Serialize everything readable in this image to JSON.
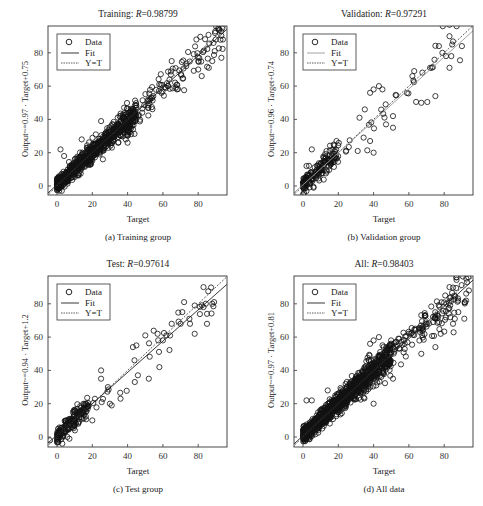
{
  "figure": {
    "panels": [
      {
        "id": "a",
        "title_prefix": "Training: ",
        "title_r_label": "R",
        "title_r_value": "=0.98799",
        "ylabel": "Output~=0.97 · Target+0.75",
        "xlabel": "Target",
        "caption": "(a) Training group",
        "legend": [
          "Data",
          "Fit",
          "Y=T"
        ]
      },
      {
        "id": "b",
        "title_prefix": "Validation: ",
        "title_r_label": "R",
        "title_r_value": "=0.97291",
        "ylabel": "Output~=0.96 · Target+0.74",
        "xlabel": "Target",
        "caption": "(b) Validation group",
        "legend": [
          "Data",
          "Fit",
          "Y=T"
        ]
      },
      {
        "id": "c",
        "title_prefix": "Test: ",
        "title_r_label": "R",
        "title_r_value": "=0.97614",
        "ylabel": "Output~=0.94 · Target+1.2",
        "xlabel": "Target",
        "caption": "(c) Test group",
        "legend": [
          "Data",
          "Fit",
          "Y=T"
        ]
      },
      {
        "id": "d",
        "title_prefix": "All: ",
        "title_r_label": "R",
        "title_r_value": "=0.98403",
        "ylabel": "Output~=0.97 · Target+0.81",
        "xlabel": "Target",
        "caption": "(d) All data",
        "legend": [
          "Data",
          "Fit",
          "Y=T"
        ]
      }
    ],
    "colors": {
      "axis": "#333333",
      "marker": "#111111",
      "fit": "#222222",
      "fit_validation": "#999999",
      "yt": "#333333"
    }
  },
  "chart_data": [
    {
      "type": "scatter",
      "title": "Training: R=0.98799",
      "xlabel": "Target",
      "ylabel": "Output~=0.97 · Target+0.75",
      "xticks": [
        0,
        20,
        40,
        60,
        80
      ],
      "yticks": [
        0,
        20,
        40,
        60,
        80
      ],
      "xlim": [
        -5,
        95
      ],
      "ylim": [
        -5,
        96
      ],
      "legend": [
        "Data",
        "Fit",
        "Y=T"
      ],
      "legend_position": "upper left",
      "fit": {
        "slope": 0.97,
        "intercept": 0.75
      },
      "generator": {
        "n": 900,
        "seed": 11,
        "spread": 3.2,
        "dense_max": 45,
        "sparse_max": 94
      },
      "notable_points": [
        [
          2,
          22
        ],
        [
          4,
          18
        ],
        [
          14,
          28
        ],
        [
          22,
          31
        ],
        [
          25,
          39
        ],
        [
          38,
          47
        ],
        [
          40,
          26
        ],
        [
          39,
          28
        ],
        [
          65,
          75
        ],
        [
          68,
          58
        ],
        [
          80,
          70
        ],
        [
          82,
          66
        ],
        [
          86,
          71
        ],
        [
          88,
          75
        ],
        [
          93,
          93
        ],
        [
          94,
          88
        ],
        [
          79,
          88
        ],
        [
          90,
          88
        ]
      ]
    },
    {
      "type": "scatter",
      "title": "Validation: R=0.97291",
      "xlabel": "Target",
      "ylabel": "Output~=0.96 · Target+0.74",
      "xticks": [
        0,
        20,
        40,
        60,
        80
      ],
      "yticks": [
        0,
        20,
        40,
        60,
        80
      ],
      "xlim": [
        -5,
        95
      ],
      "ylim": [
        -5,
        96
      ],
      "legend": [
        "Data",
        "Fit",
        "Y=T"
      ],
      "legend_position": "upper left",
      "fit": {
        "slope": 0.96,
        "intercept": 0.74
      },
      "generator": {
        "n": 200,
        "seed": 23,
        "spread": 4.0,
        "dense_max": 20,
        "sparse_max": 90
      },
      "notable_points": [
        [
          0,
          -5
        ],
        [
          5,
          22
        ],
        [
          2,
          12
        ],
        [
          38,
          27
        ],
        [
          40,
          20
        ],
        [
          31,
          21
        ],
        [
          38,
          56
        ],
        [
          40,
          58
        ],
        [
          43,
          60
        ],
        [
          45,
          58
        ],
        [
          47,
          37
        ],
        [
          51,
          35
        ],
        [
          51,
          42
        ],
        [
          62,
          66
        ],
        [
          63,
          69
        ],
        [
          67,
          50
        ],
        [
          72,
          71
        ],
        [
          75,
          54
        ],
        [
          77,
          84
        ],
        [
          79,
          80
        ],
        [
          81,
          78
        ],
        [
          83,
          90
        ],
        [
          84,
          78
        ],
        [
          83,
          71
        ],
        [
          87,
          96
        ],
        [
          90,
          84
        ],
        [
          35,
          46
        ],
        [
          32,
          41
        ]
      ]
    },
    {
      "type": "scatter",
      "title": "Test: R=0.97614",
      "xlabel": "Target",
      "ylabel": "Output~=0.94 · Target+1.2",
      "xticks": [
        0,
        20,
        40,
        60,
        80
      ],
      "yticks": [
        0,
        20,
        40,
        60,
        80
      ],
      "xlim": [
        -5,
        95
      ],
      "ylim": [
        -5,
        96
      ],
      "legend": [
        "Data",
        "Fit",
        "Y=T"
      ],
      "legend_position": "upper left",
      "fit": {
        "slope": 0.94,
        "intercept": 1.2
      },
      "generator": {
        "n": 200,
        "seed": 37,
        "spread": 4.0,
        "dense_max": 18,
        "sparse_max": 90
      },
      "notable_points": [
        [
          -4,
          -2
        ],
        [
          3,
          -4
        ],
        [
          7,
          -1
        ],
        [
          20,
          10
        ],
        [
          25,
          35
        ],
        [
          25,
          40
        ],
        [
          31,
          19
        ],
        [
          30,
          20
        ],
        [
          36,
          23
        ],
        [
          43,
          54
        ],
        [
          45,
          55
        ],
        [
          50,
          61
        ],
        [
          52,
          35
        ],
        [
          57,
          62
        ],
        [
          58,
          42
        ],
        [
          60,
          58
        ],
        [
          62,
          61
        ],
        [
          65,
          68
        ],
        [
          70,
          68
        ],
        [
          71,
          75
        ],
        [
          72,
          81
        ],
        [
          75,
          71
        ],
        [
          78,
          62
        ],
        [
          78,
          79
        ],
        [
          83,
          90
        ],
        [
          83,
          78
        ],
        [
          85,
          68
        ],
        [
          85,
          74
        ],
        [
          88,
          80
        ],
        [
          89,
          81
        ]
      ]
    },
    {
      "type": "scatter",
      "title": "All: R=0.98403",
      "xlabel": "Target",
      "ylabel": "Output~=0.97 · Target+0.81",
      "xticks": [
        0,
        20,
        40,
        60,
        80
      ],
      "yticks": [
        0,
        20,
        40,
        60,
        80
      ],
      "xlim": [
        -5,
        95
      ],
      "ylim": [
        -5,
        96
      ],
      "legend": [
        "Data",
        "Fit",
        "Y=T"
      ],
      "legend_position": "upper left",
      "fit": {
        "slope": 0.97,
        "intercept": 0.81
      },
      "generator": {
        "n": 1300,
        "seed": 53,
        "spread": 3.4,
        "dense_max": 50,
        "sparse_max": 94
      },
      "notable_points": [
        [
          2,
          22
        ],
        [
          5,
          22
        ],
        [
          14,
          28
        ],
        [
          38,
          56
        ],
        [
          40,
          58
        ],
        [
          43,
          60
        ],
        [
          40,
          20
        ],
        [
          51,
          35
        ],
        [
          67,
          50
        ],
        [
          75,
          54
        ],
        [
          78,
          62
        ],
        [
          83,
          90
        ],
        [
          85,
          68
        ],
        [
          86,
          71
        ],
        [
          87,
          96
        ],
        [
          88,
          75
        ],
        [
          93,
          93
        ],
        [
          94,
          88
        ]
      ]
    }
  ]
}
